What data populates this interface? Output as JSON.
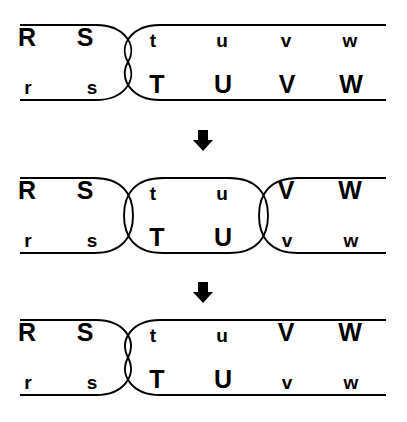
{
  "figure": {
    "background_color": "#ffffff",
    "line_color": "#000000",
    "width": 407,
    "height": 422
  },
  "panels": [
    {
      "id": "panel-1",
      "order": 1,
      "top_row": {
        "labels": [
          "R",
          "S",
          "t",
          "u",
          "v",
          "w"
        ],
        "cases": [
          "upper",
          "upper",
          "lower",
          "lower",
          "lower",
          "lower"
        ],
        "x": [
          27,
          85,
          153,
          222,
          286,
          350
        ],
        "baseline_y": 50
      },
      "bottom_row": {
        "labels": [
          "r",
          "s",
          "T",
          "U",
          "V",
          "W"
        ],
        "cases": [
          "lower",
          "lower",
          "upper",
          "upper",
          "upper",
          "upper"
        ],
        "x": [
          28,
          92,
          157,
          223,
          287,
          351
        ],
        "baseline_y": 97
      },
      "line_top_y": 25,
      "line_bottom_y": 100,
      "line_x_start": 20,
      "line_x_end": 386,
      "crossings": [
        {
          "type": "bowtie",
          "center_x": 128,
          "half_width": 34
        }
      ]
    },
    {
      "id": "panel-2",
      "order": 2,
      "top_row": {
        "labels": [
          "R",
          "S",
          "t",
          "u",
          "V",
          "W"
        ],
        "cases": [
          "upper",
          "upper",
          "lower",
          "lower",
          "upper",
          "upper"
        ],
        "x": [
          27,
          85,
          153,
          222,
          286,
          350
        ],
        "baseline_y": 203
      },
      "bottom_row": {
        "labels": [
          "r",
          "s",
          "T",
          "U",
          "v",
          "w"
        ],
        "cases": [
          "lower",
          "lower",
          "upper",
          "upper",
          "lower",
          "lower"
        ],
        "x": [
          28,
          92,
          157,
          223,
          287,
          351
        ],
        "baseline_y": 250
      },
      "line_top_y": 178,
      "line_bottom_y": 253,
      "line_x_start": 20,
      "line_x_end": 386,
      "crossings": [
        {
          "type": "tangent-caps",
          "center_x": 128,
          "half_width": 34
        },
        {
          "type": "tangent-caps",
          "center_x": 263,
          "half_width": 34
        }
      ]
    },
    {
      "id": "panel-3",
      "order": 3,
      "top_row": {
        "labels": [
          "R",
          "S",
          "t",
          "u",
          "V",
          "W"
        ],
        "cases": [
          "upper",
          "upper",
          "lower",
          "lower",
          "upper",
          "upper"
        ],
        "x": [
          27,
          85,
          153,
          222,
          286,
          350
        ],
        "baseline_y": 345
      },
      "bottom_row": {
        "labels": [
          "r",
          "s",
          "T",
          "U",
          "v",
          "w"
        ],
        "cases": [
          "lower",
          "lower",
          "upper",
          "upper",
          "lower",
          "lower"
        ],
        "x": [
          28,
          92,
          157,
          223,
          287,
          351
        ],
        "baseline_y": 392
      },
      "line_top_y": 320,
      "line_bottom_y": 395,
      "line_x_start": 20,
      "line_x_end": 386,
      "crossings": [
        {
          "type": "bowtie",
          "center_x": 128,
          "half_width": 34
        }
      ]
    }
  ],
  "arrows": [
    {
      "id": "arrow-1",
      "direction": "down",
      "x": 203,
      "y": 137,
      "glyph": "down-arrow"
    },
    {
      "id": "arrow-2",
      "direction": "down",
      "x": 203,
      "y": 289,
      "glyph": "down-arrow"
    }
  ]
}
